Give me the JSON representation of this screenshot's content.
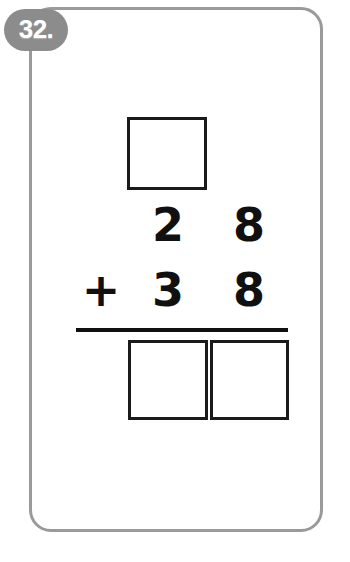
{
  "page": {
    "type": "math-worksheet-problem-card",
    "background_color": "#ffffff"
  },
  "badge": {
    "label": "32.",
    "background_color": "#8c8c8c",
    "text_color": "#ffffff"
  },
  "card": {
    "border_color": "#9a9a9a",
    "fill_color": "#ffffff",
    "corner_radius": "22px"
  },
  "problem": {
    "operation": "+",
    "operator_symbol": "+",
    "addend_1": {
      "value": "28",
      "tens": "2",
      "ones": "8"
    },
    "addend_2": {
      "value": "38",
      "tens": "3",
      "ones": "8"
    },
    "carry_box_value": "",
    "answer_tens_value": "",
    "answer_ones_value": "",
    "rule_color": "#101010",
    "digit_color": "#101010",
    "box_border_color": "#1a1a1a"
  },
  "margin": {
    "rotated_text": ""
  }
}
